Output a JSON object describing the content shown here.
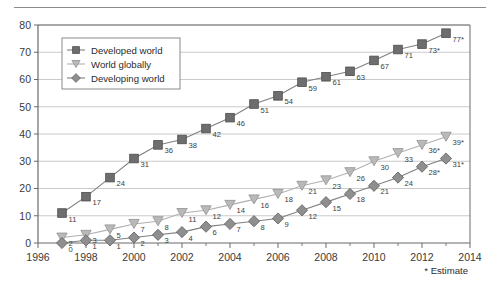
{
  "chart_data": {
    "type": "line",
    "title": "",
    "subtitle": "",
    "xlabel": "",
    "ylabel": "",
    "x": [
      1997,
      1998,
      1999,
      2000,
      2001,
      2002,
      2003,
      2004,
      2005,
      2006,
      2007,
      2008,
      2009,
      2010,
      2011,
      2012,
      2013
    ],
    "xlim": [
      1996,
      2014
    ],
    "ylim": [
      0,
      80
    ],
    "ytick_labels": [
      "0",
      "10",
      "20",
      "30",
      "40",
      "50",
      "60",
      "70",
      "80"
    ],
    "yticks": [
      0,
      10,
      20,
      30,
      40,
      50,
      60,
      70,
      80
    ],
    "xtick_labels": [
      "1996",
      "1998",
      "2000",
      "2002",
      "2004",
      "2006",
      "2008",
      "2010",
      "2012",
      "2014"
    ],
    "xticks": [
      1996,
      1998,
      2000,
      2002,
      2004,
      2006,
      2008,
      2010,
      2012,
      2014
    ],
    "minor_xticks": [
      1997,
      1999,
      2001,
      2003,
      2005,
      2007,
      2009,
      2011,
      2013
    ],
    "grid": "horizontal",
    "legend_position": "upper-left-inside",
    "series": [
      {
        "name": "Developed world",
        "marker": "square",
        "color": "#6e6e6e",
        "values": [
          11,
          17,
          24,
          31,
          36,
          38,
          42,
          46,
          51,
          54,
          59,
          61,
          63,
          67,
          71,
          73,
          77
        ],
        "point_labels": [
          "11",
          "17",
          "24",
          "31",
          "36",
          "38",
          "42",
          "46",
          "51",
          "54",
          "59",
          "61",
          "63",
          "67",
          "71",
          "73*",
          "77*"
        ]
      },
      {
        "name": "World globally",
        "marker": "triangle-down",
        "color": "#b9b9b9",
        "values": [
          2,
          3,
          5,
          7,
          8,
          11,
          12,
          14,
          16,
          18,
          21,
          23,
          26,
          30,
          33,
          36,
          39
        ],
        "point_labels": [
          "2",
          "3",
          "5",
          "7",
          "8",
          "11",
          "12",
          "14",
          "16",
          "18",
          "21",
          "23",
          "26",
          "30",
          "33",
          "36*",
          "39*"
        ]
      },
      {
        "name": "Developing world",
        "marker": "diamond",
        "color": "#8f8f8f",
        "values": [
          0,
          1,
          1,
          2,
          3,
          4,
          6,
          7,
          8,
          9,
          12,
          15,
          18,
          21,
          24,
          28,
          31
        ],
        "point_labels": [
          "0",
          "1",
          "1",
          "2",
          "3",
          "4",
          "6",
          "7",
          "8",
          "9",
          "12",
          "15",
          "18",
          "21",
          "24",
          "28*",
          "31*"
        ]
      }
    ],
    "annotations": [
      {
        "name": "estimate-footnote",
        "text": "* Estimate"
      }
    ]
  },
  "legend": {
    "items": [
      {
        "label": "Developed world"
      },
      {
        "label": "World globally"
      },
      {
        "label": "Developing world"
      }
    ]
  },
  "footnote": {
    "text": "* Estimate"
  }
}
